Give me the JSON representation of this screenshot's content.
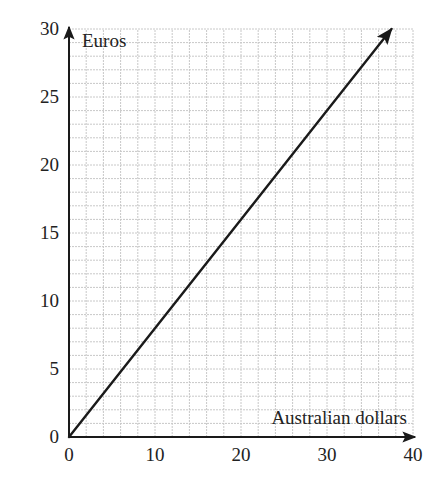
{
  "chart_data": {
    "type": "line",
    "title": "",
    "xlabel": "Australian dollars",
    "ylabel": "Euros",
    "xlim": [
      0,
      40
    ],
    "ylim": [
      0,
      30
    ],
    "x_ticks": [
      0,
      10,
      20,
      30,
      40
    ],
    "y_ticks": [
      0,
      5,
      10,
      15,
      20,
      25,
      30
    ],
    "grid": true,
    "grid_minor_x_step": 2,
    "grid_minor_y_step": 1,
    "legend": null,
    "series": [
      {
        "name": "Euros vs Australian dollars",
        "x": [
          0,
          10,
          20,
          30,
          37.5
        ],
        "y": [
          0,
          8,
          16,
          24,
          30
        ],
        "arrow_end": true,
        "color": "#1a1a1a"
      }
    ],
    "annotations": []
  },
  "colors": {
    "grid": "#c8c8c8",
    "axis": "#1a1a1a",
    "line": "#1a1a1a"
  }
}
